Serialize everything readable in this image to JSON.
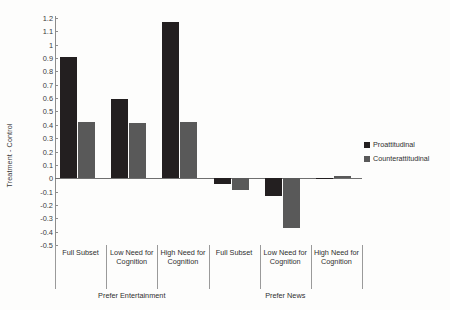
{
  "chart_data": {
    "type": "bar",
    "title": "",
    "xlabel": "",
    "ylabel": "Treatment - Control",
    "ylim": [
      -0.5,
      1.2
    ],
    "ytick_step": 0.1,
    "grid": false,
    "legend_position": "right",
    "orientation": "vertical",
    "group_mode": "grouped",
    "yticks": [
      "1.2",
      "1.1",
      "1",
      "0.9",
      "0.8",
      "0.7",
      "0.6",
      "0.5",
      "0.4",
      "0.3",
      "0.2",
      "0.1",
      "0",
      "-0.1",
      "-0.2",
      "-0.3",
      "-0.4",
      "-0.5"
    ],
    "ytick_values": [
      1.2,
      1.1,
      1.0,
      0.9,
      0.8,
      0.7,
      0.6,
      0.5,
      0.4,
      0.3,
      0.2,
      0.1,
      0,
      -0.1,
      -0.2,
      -0.3,
      -0.4,
      -0.5
    ],
    "categories": [
      "Full Subset",
      "Low Need for Cognition",
      "High Need for Cognition",
      "Full Subset",
      "Low Need for Cognition",
      "High Need for Cognition"
    ],
    "super_groups": [
      {
        "label": "Prefer Entertainment",
        "category_indices": [
          0,
          1,
          2
        ]
      },
      {
        "label": "Prefer News",
        "category_indices": [
          3,
          4,
          5
        ]
      }
    ],
    "series": [
      {
        "name": "Proattitudinal",
        "color": "#231f20",
        "values": [
          0.91,
          0.59,
          1.17,
          -0.04,
          -0.13,
          0.0
        ]
      },
      {
        "name": "Counterattitudinal",
        "color": "#595959",
        "values": [
          0.42,
          0.41,
          0.42,
          -0.09,
          -0.37,
          0.015
        ]
      }
    ]
  },
  "legend": {
    "items": [
      {
        "label": "Proattitudinal",
        "color": "#231f20"
      },
      {
        "label": "Counterattitudinal",
        "color": "#595959"
      }
    ]
  },
  "axis": {
    "y_title": "Treatment - Control"
  }
}
